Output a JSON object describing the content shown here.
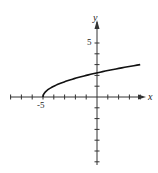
{
  "chart_data": {
    "type": "line",
    "title": "",
    "xlabel": "x",
    "ylabel": "y",
    "function": "y = sqrt(x + 5)",
    "xlim": [
      -8,
      5
    ],
    "ylim": [
      -6,
      6
    ],
    "grid": false,
    "x_tick_labels": [
      "-5"
    ],
    "y_tick_labels": [
      "5"
    ],
    "series": [
      {
        "name": "y = sqrt(x+5)",
        "x": [
          -5,
          -4.5,
          -4,
          -3,
          -2,
          -1,
          0,
          1,
          2,
          3,
          4
        ],
        "y": [
          0,
          0.71,
          1,
          1.41,
          1.73,
          2,
          2.24,
          2.45,
          2.65,
          2.83,
          3
        ]
      }
    ],
    "legend": null
  },
  "labels": {
    "x_axis": "x",
    "y_axis": "y",
    "x_tick": "-5",
    "y_tick": "5"
  },
  "colors": {
    "axis": "#333333",
    "curve": "#111111"
  }
}
